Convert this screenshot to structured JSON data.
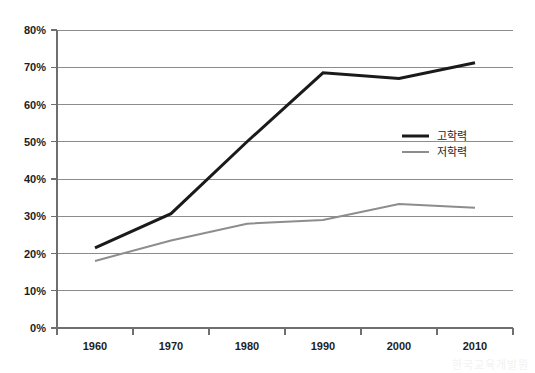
{
  "chart_data": {
    "type": "line",
    "title": "",
    "xlabel": "",
    "ylabel": "",
    "categories": [
      "1960",
      "1970",
      "1980",
      "1990",
      "2000",
      "2010"
    ],
    "ylim": [
      0,
      80
    ],
    "ytick_labels": [
      "80%",
      "70%",
      "60%",
      "50%",
      "40%",
      "30%",
      "20%",
      "10%",
      "0%"
    ],
    "ytick_values": [
      80,
      70,
      60,
      50,
      40,
      30,
      20,
      10,
      0
    ],
    "grid": true,
    "legend_position": "center-right",
    "series": [
      {
        "name": "고학력",
        "color": "#1a1a1a",
        "values": [
          21.5,
          30.7,
          50.0,
          68.5,
          67.0,
          71.2
        ]
      },
      {
        "name": "저학력",
        "color": "#8d8d8d",
        "values": [
          18.0,
          23.5,
          28.0,
          29.0,
          33.3,
          32.3
        ]
      }
    ]
  },
  "plot": {
    "left": 57,
    "right": 513,
    "top": 30,
    "bottom": 328
  },
  "legend": {
    "x": 402,
    "y": 136,
    "line_length": 27,
    "row_gap": 16,
    "text_offset": 35
  },
  "artifact": {
    "bleed_text": "한국교육개발원"
  }
}
